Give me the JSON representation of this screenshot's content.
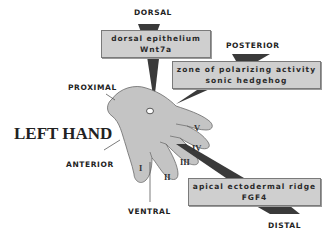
{
  "title": "LEFT HAND",
  "axes": {
    "dorsal": "DORSAL",
    "posterior": "POSTERIOR",
    "proximal": "PROXIMAL",
    "anterior": "ANTERIOR",
    "ventral": "VENTRAL",
    "distal": "DISTAL"
  },
  "boxes": {
    "dorsal": {
      "line1": "dorsal epithelium",
      "line2": "Wnt7a"
    },
    "zpa": {
      "line1": "zone of polarizing activity",
      "line2": "sonic hedgehog"
    },
    "aer": {
      "line1": "apical ectodermal ridge",
      "line2": "FGF4"
    }
  },
  "digits": [
    "I",
    "II",
    "III",
    "IV",
    "V"
  ],
  "colors": {
    "hand_fill": "#c4c4c4",
    "box_fill": "#cfcfcf",
    "wedge": "#3a3a3a"
  }
}
